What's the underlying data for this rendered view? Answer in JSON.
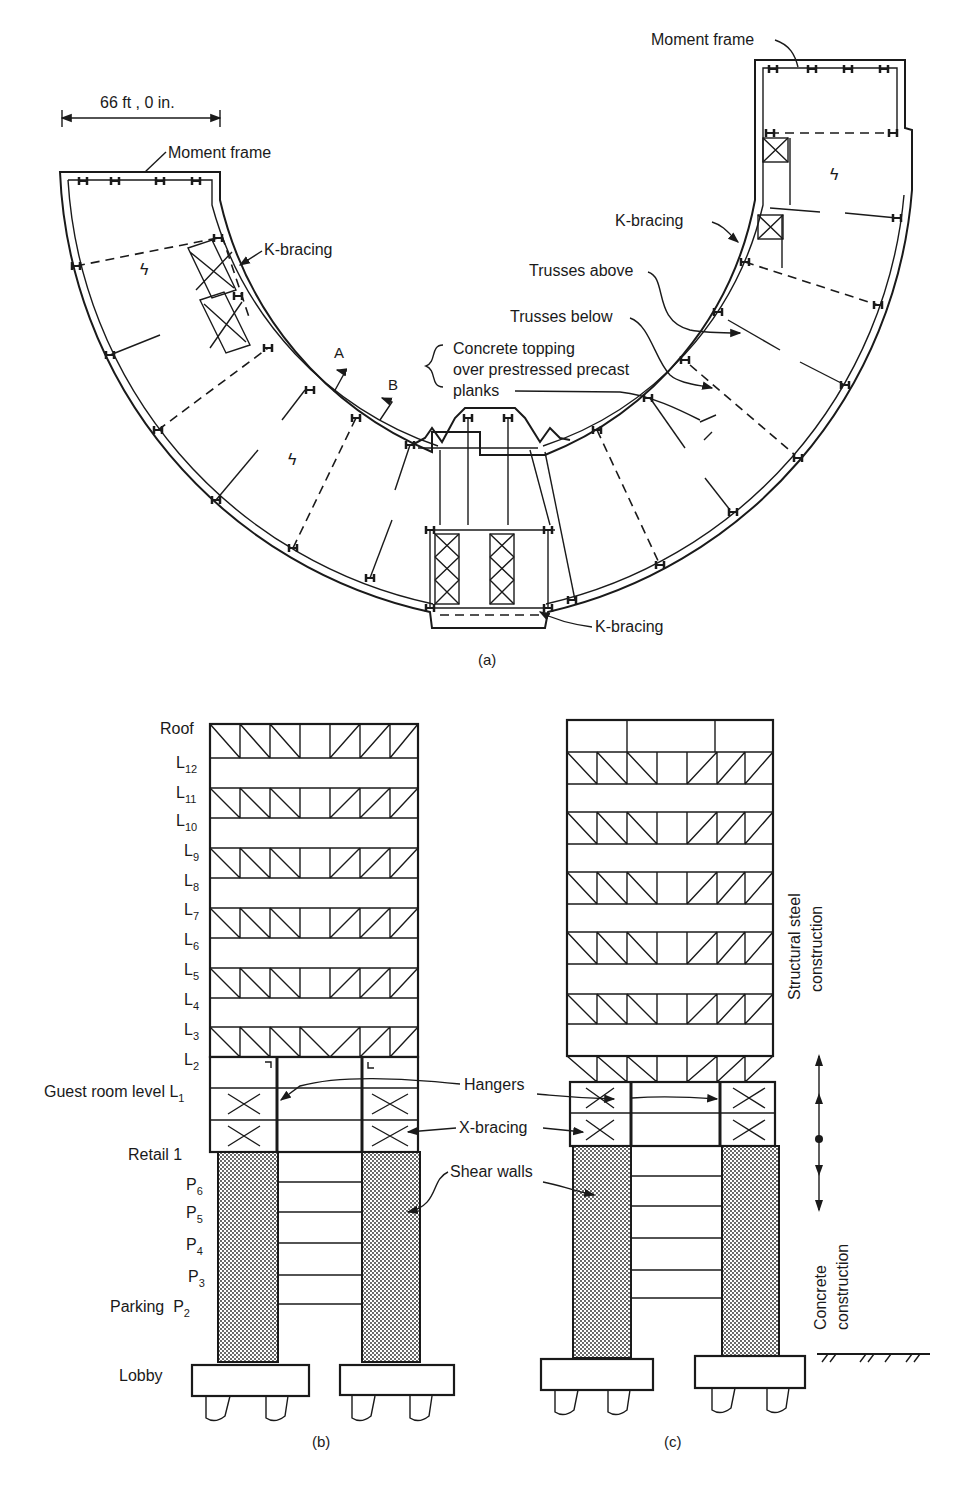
{
  "plan_view": {
    "caption": "(a)",
    "dimension": "66 ft , 0 in.",
    "labels": {
      "moment_frame_left": "Moment frame",
      "moment_frame_right": "Moment frame",
      "k_bracing_left": "K-bracing",
      "k_bracing_right": "K-bracing",
      "k_bracing_bottom": "K-bracing",
      "trusses_above": "Trusses above",
      "trusses_below": "Trusses below",
      "concrete_line1": "Concrete topping",
      "concrete_line2": "over prestressed precast",
      "concrete_line3": "planks",
      "section_a": "A",
      "section_b": "B"
    }
  },
  "elevation_b": {
    "caption": "(b)",
    "levels": [
      {
        "base": "Roof",
        "sub": ""
      },
      {
        "base": "L",
        "sub": "12"
      },
      {
        "base": "L",
        "sub": "11"
      },
      {
        "base": "L",
        "sub": "10"
      },
      {
        "base": "L",
        "sub": "9"
      },
      {
        "base": "L",
        "sub": "8"
      },
      {
        "base": "L",
        "sub": "7"
      },
      {
        "base": "L",
        "sub": "6"
      },
      {
        "base": "L",
        "sub": "5"
      },
      {
        "base": "L",
        "sub": "4"
      },
      {
        "base": "L",
        "sub": "3"
      },
      {
        "base": "L",
        "sub": "2"
      },
      {
        "base": "Guest room level L",
        "sub": "1"
      },
      {
        "base": "Retail 1",
        "sub": ""
      },
      {
        "base": "P",
        "sub": "6"
      },
      {
        "base": "P",
        "sub": "5"
      },
      {
        "base": "P",
        "sub": "4"
      },
      {
        "base": "P",
        "sub": "3"
      },
      {
        "base": "Parking  P",
        "sub": "2"
      },
      {
        "base": "Lobby",
        "sub": ""
      }
    ]
  },
  "elevation_c": {
    "caption": "(c)"
  },
  "callouts": {
    "hangers": "Hangers",
    "x_bracing": "X-bracing",
    "shear_walls": "Shear walls"
  },
  "construction_zones": {
    "steel_line1": "Structural steel",
    "steel_line2": "construction",
    "concrete_line1": "Concrete",
    "concrete_line2": "construction"
  },
  "colors": {
    "ink": "#1a1a1a",
    "background": "#ffffff",
    "concrete_fill": "#9a9a9a"
  }
}
